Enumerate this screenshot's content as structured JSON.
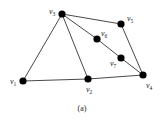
{
  "figure": {
    "caption": "(a)",
    "colors": {
      "node": "#000000",
      "edge": "#333333",
      "text": "#222222",
      "background": "#ffffff"
    },
    "nodes": [
      {
        "id": "v1",
        "base": "v",
        "sub": "1",
        "x": 23,
        "y": 81,
        "label_x": 10,
        "label_y": 84
      },
      {
        "id": "v2",
        "base": "v",
        "sub": "2",
        "x": 88,
        "y": 79,
        "label_x": 86,
        "label_y": 92
      },
      {
        "id": "v3",
        "base": "v",
        "sub": "3",
        "x": 62,
        "y": 14,
        "label_x": 49,
        "label_y": 14
      },
      {
        "id": "v4",
        "base": "v",
        "sub": "4",
        "x": 143,
        "y": 75,
        "label_x": 146,
        "label_y": 88
      },
      {
        "id": "v5",
        "base": "v",
        "sub": "5",
        "x": 121,
        "y": 24,
        "label_x": 127,
        "label_y": 21
      },
      {
        "id": "v6",
        "base": "v",
        "sub": "6",
        "x": 97,
        "y": 39,
        "label_x": 101,
        "label_y": 36
      },
      {
        "id": "v7",
        "base": "v",
        "sub": "7",
        "x": 121,
        "y": 58,
        "label_x": 110,
        "label_y": 66
      }
    ],
    "edges": [
      [
        "v1",
        "v3"
      ],
      [
        "v3",
        "v2"
      ],
      [
        "v3",
        "v5"
      ],
      [
        "v3",
        "v6"
      ],
      [
        "v6",
        "v7"
      ],
      [
        "v7",
        "v4"
      ],
      [
        "v5",
        "v4"
      ],
      [
        "v1",
        "v2"
      ],
      [
        "v2",
        "v4"
      ]
    ]
  }
}
